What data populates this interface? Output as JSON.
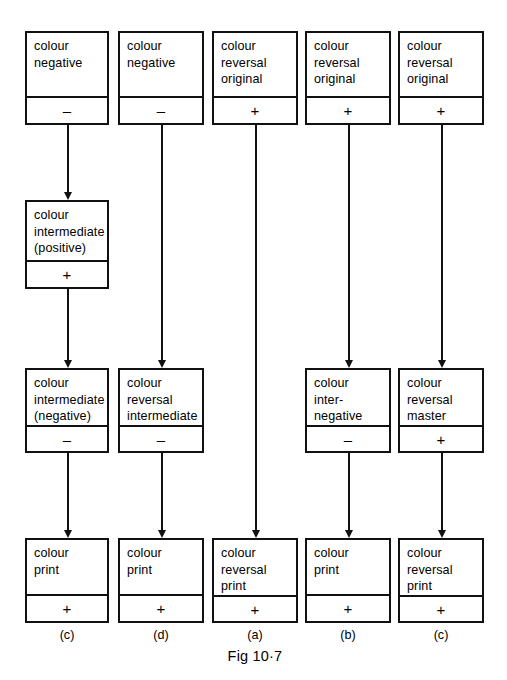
{
  "figure": {
    "caption": "Fig 10·7",
    "caption_x": 212,
    "caption_y": 648
  },
  "columns": [
    {
      "x": 25,
      "width": 84,
      "center": 67,
      "label": "(c)"
    },
    {
      "x": 118,
      "width": 86,
      "center": 161,
      "label": "(d)"
    },
    {
      "x": 212,
      "width": 86,
      "center": 255,
      "label": "(a)"
    },
    {
      "x": 305,
      "width": 86,
      "center": 348,
      "label": "(b)"
    },
    {
      "x": 398,
      "width": 86,
      "center": 441,
      "label": "(c)"
    }
  ],
  "rows": [
    {
      "y": 31,
      "height": 94
    },
    {
      "y": 200,
      "height": 89
    },
    {
      "y": 368,
      "height": 85
    },
    {
      "y": 538,
      "height": 85
    }
  ],
  "nodes": [
    {
      "id": "n-r1c1",
      "name": "node-colour-negative-1",
      "col": 0,
      "row": 0,
      "label": "colour\nnegative",
      "sign": "–"
    },
    {
      "id": "n-r1c2",
      "name": "node-colour-negative-2",
      "col": 1,
      "row": 0,
      "label": "colour\nnegative",
      "sign": "–"
    },
    {
      "id": "n-r1c3",
      "name": "node-colour-reversal-original-1",
      "col": 2,
      "row": 0,
      "label": "colour\nreversal\noriginal",
      "sign": "+"
    },
    {
      "id": "n-r1c4",
      "name": "node-colour-reversal-original-2",
      "col": 3,
      "row": 0,
      "label": "colour\nreversal\noriginal",
      "sign": "+"
    },
    {
      "id": "n-r1c5",
      "name": "node-colour-reversal-original-3",
      "col": 4,
      "row": 0,
      "label": "colour\nreversal\noriginal",
      "sign": "+"
    },
    {
      "id": "n-r2c1",
      "name": "node-colour-intermediate-positive",
      "col": 0,
      "row": 1,
      "label": "colour\nintermediate\n(positive)",
      "sign": "+"
    },
    {
      "id": "n-r3c1",
      "name": "node-colour-intermediate-negative",
      "col": 0,
      "row": 2,
      "label": "colour\nintermediate\n(negative)",
      "sign": "–"
    },
    {
      "id": "n-r3c2",
      "name": "node-colour-reversal-intermediate",
      "col": 1,
      "row": 2,
      "label": "colour\nreversal\nintermediate",
      "sign": "–"
    },
    {
      "id": "n-r3c4",
      "name": "node-colour-internegative",
      "col": 3,
      "row": 2,
      "label": "colour\ninter-\nnegative",
      "sign": "–"
    },
    {
      "id": "n-r3c5",
      "name": "node-colour-reversal-master",
      "col": 4,
      "row": 2,
      "label": "colour\nreversal\nmaster",
      "sign": "+"
    },
    {
      "id": "n-r4c1",
      "name": "node-colour-print-1",
      "col": 0,
      "row": 3,
      "label": "colour\nprint",
      "sign": "+"
    },
    {
      "id": "n-r4c2",
      "name": "node-colour-print-2",
      "col": 1,
      "row": 3,
      "label": "colour\nprint",
      "sign": "+"
    },
    {
      "id": "n-r4c3",
      "name": "node-colour-reversal-print-1",
      "col": 2,
      "row": 3,
      "label": "colour\nreversal\nprint",
      "sign": "+"
    },
    {
      "id": "n-r4c4",
      "name": "node-colour-print-3",
      "col": 3,
      "row": 3,
      "label": "colour\nprint",
      "sign": "+"
    },
    {
      "id": "n-r4c5",
      "name": "node-colour-reversal-print-2",
      "col": 4,
      "row": 3,
      "label": "colour\nreversal\nprint",
      "sign": "+"
    }
  ],
  "connectors": [
    {
      "name": "arrow-col1-row1-to-row2",
      "col": 0,
      "from_y": 125,
      "to_y": 200
    },
    {
      "name": "arrow-col1-row2-to-row3",
      "col": 0,
      "from_y": 289,
      "to_y": 368
    },
    {
      "name": "arrow-col1-row3-to-row4",
      "col": 0,
      "from_y": 453,
      "to_y": 538
    },
    {
      "name": "arrow-col2-row1-to-row3",
      "col": 1,
      "from_y": 125,
      "to_y": 368
    },
    {
      "name": "arrow-col2-row3-to-row4",
      "col": 1,
      "from_y": 453,
      "to_y": 538
    },
    {
      "name": "arrow-col3-row1-to-row4",
      "col": 2,
      "from_y": 125,
      "to_y": 538
    },
    {
      "name": "arrow-col4-row1-to-row3",
      "col": 3,
      "from_y": 125,
      "to_y": 368
    },
    {
      "name": "arrow-col4-row3-to-row4",
      "col": 3,
      "from_y": 453,
      "to_y": 538
    },
    {
      "name": "arrow-col5-row1-to-row3",
      "col": 4,
      "from_y": 125,
      "to_y": 368
    },
    {
      "name": "arrow-col5-row3-to-row4",
      "col": 4,
      "from_y": 453,
      "to_y": 538
    }
  ],
  "column_labels_y": 628
}
